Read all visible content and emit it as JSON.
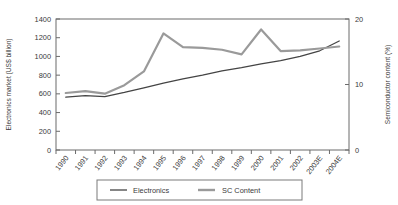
{
  "chart_data": {
    "type": "line",
    "title": "",
    "xlabel": "",
    "categories": [
      "1990",
      "1991",
      "1992",
      "1993",
      "1994",
      "1995",
      "1996",
      "1997",
      "1998",
      "1999",
      "2000",
      "2001",
      "2002",
      "2003E",
      "2004E"
    ],
    "series": [
      {
        "name": "Electronics",
        "axis": "left",
        "ylabel": "Electronics market (US$ billion)",
        "color": "#444444",
        "values": [
          565,
          580,
          570,
          615,
          665,
          715,
          760,
          800,
          845,
          880,
          920,
          955,
          1000,
          1060,
          1165
        ]
      },
      {
        "name": "SC Content",
        "axis": "right",
        "ylabel": "Semiconductor content (%)",
        "color": "#9a9a9a",
        "values": [
          8.7,
          9.0,
          8.6,
          9.9,
          12.0,
          17.8,
          15.7,
          15.6,
          15.3,
          14.6,
          18.4,
          15.1,
          15.2,
          15.5,
          15.8
        ]
      }
    ],
    "left_axis": {
      "label": "Electronics market (US$ billion)",
      "ticks": [
        0,
        200,
        400,
        600,
        800,
        1000,
        1200,
        1400
      ],
      "ylim": [
        0,
        1400
      ]
    },
    "right_axis": {
      "label": "Semiconductor content (%)",
      "ticks": [
        0,
        10,
        20
      ],
      "ylim": [
        0,
        20
      ]
    },
    "legend": {
      "position": "bottom-center",
      "entries": [
        {
          "label": "Electronics",
          "color": "#444444"
        },
        {
          "label": "SC Content",
          "color": "#9a9a9a"
        }
      ]
    },
    "grid": false
  }
}
